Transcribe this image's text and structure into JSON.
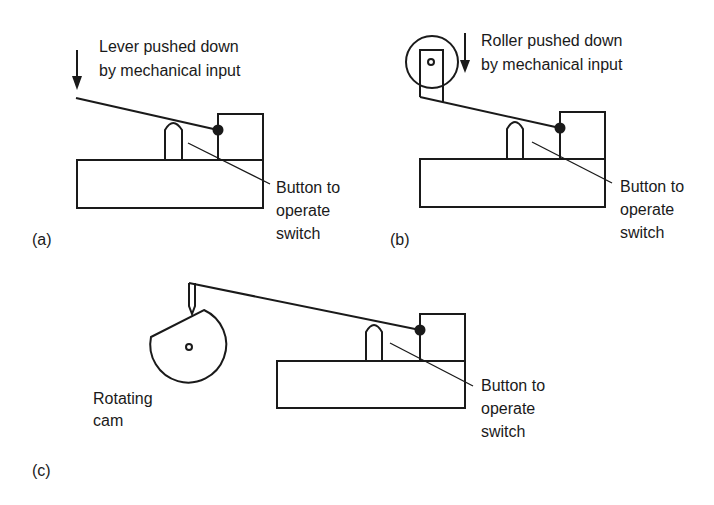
{
  "figure": {
    "panels": [
      {
        "id": "a",
        "tag": "(a)",
        "caption_lines": [
          "Lever pushed down",
          "by mechanical  input"
        ],
        "callout_lines": [
          "Button to",
          "operate",
          "switch"
        ],
        "actuator": "lever"
      },
      {
        "id": "b",
        "tag": "(b)",
        "caption_lines": [
          "Roller pushed down",
          "by mechanical  input"
        ],
        "callout_lines": [
          "Button to",
          "operate",
          "switch"
        ],
        "actuator": "roller"
      },
      {
        "id": "c",
        "tag": "(c)",
        "caption_lines": [
          "Rotating",
          "cam"
        ],
        "callout_lines": [
          "Button to",
          "operate",
          "switch"
        ],
        "actuator": "cam"
      }
    ],
    "colors": {
      "ink": "#1a1a1a",
      "background": "#ffffff"
    }
  }
}
